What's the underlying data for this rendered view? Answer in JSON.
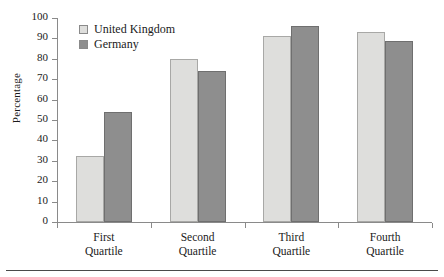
{
  "chart_data": {
    "type": "bar",
    "title": "",
    "xlabel": "",
    "ylabel": "Percentage",
    "ylim": [
      0,
      100
    ],
    "ytick_step": 10,
    "yticks": [
      100,
      90,
      80,
      70,
      60,
      50,
      40,
      30,
      20,
      10,
      0
    ],
    "grid": false,
    "legend_position": "top-left inside",
    "categories": [
      "First Quartile",
      "Second Quartile",
      "Third Quartile",
      "Fourth Quartile"
    ],
    "category_lines": [
      [
        "First",
        "Quartile"
      ],
      [
        "Second",
        "Quartile"
      ],
      [
        "Third",
        "Quartile"
      ],
      [
        "Fourth",
        "Quartile"
      ]
    ],
    "series": [
      {
        "name": "United Kingdom",
        "color": "#dededc",
        "values": [
          32.5,
          80,
          91,
          93
        ]
      },
      {
        "name": "Germany",
        "color": "#8e8e8e",
        "values": [
          54,
          74,
          96,
          88.5
        ]
      }
    ]
  },
  "legend": {
    "items": [
      {
        "label": "United Kingdom",
        "swatch": "uk"
      },
      {
        "label": "Germany",
        "swatch": "de"
      }
    ]
  }
}
